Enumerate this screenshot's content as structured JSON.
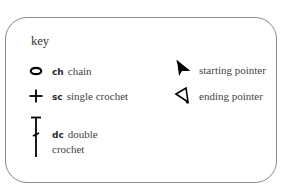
{
  "key": {
    "title": "key",
    "items": [
      {
        "symbol": "oval-icon",
        "abbr": "ch",
        "label": "chain"
      },
      {
        "symbol": "plus-icon",
        "abbr": "sc",
        "label": "single crochet"
      },
      {
        "symbol": "double-crochet-icon",
        "abbr": "dc",
        "label_line1": "double",
        "label_line2": "crochet"
      },
      {
        "symbol": "filled-arrow-icon",
        "label": "starting pointer"
      },
      {
        "symbol": "outline-arrow-icon",
        "label": "ending pointer"
      }
    ]
  },
  "colors": {
    "border": "#8a8a8a",
    "symbol": "#000000",
    "text": "#444444"
  }
}
